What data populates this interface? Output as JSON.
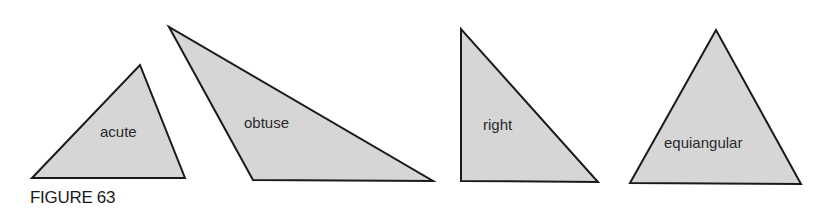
{
  "figure": {
    "caption": "FIGURE 63",
    "triangles": [
      {
        "label": "acute",
        "points": "32,178 140,65 185,178",
        "label_x": 100,
        "label_y": 137
      },
      {
        "label": "obtuse",
        "points": "169,27 253,180 433,181",
        "label_x": 244,
        "label_y": 128
      },
      {
        "label": "right",
        "points": "461,29 461,181 598,182",
        "label_x": 483,
        "label_y": 130
      },
      {
        "label": "equiangular",
        "points": "716,30 630,183 801,184",
        "label_x": 664,
        "label_y": 148
      }
    ],
    "colors": {
      "fill": "#d6d6d6",
      "stroke": "#1a1a1a"
    }
  }
}
